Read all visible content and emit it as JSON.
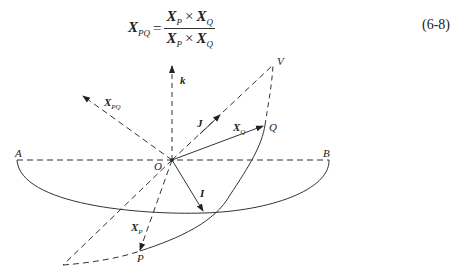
{
  "equation": {
    "lhs": "X",
    "lhs_sub": "PQ",
    "equals": "=",
    "numerator": {
      "a": "X",
      "a_sub": "P",
      "op": "×",
      "b": "X",
      "b_sub": "Q"
    },
    "denominator": {
      "a": "X",
      "a_sub": "P",
      "op": "×",
      "b": "X",
      "b_sub": "Q"
    },
    "number": "(6-8)"
  },
  "diagram": {
    "points": {
      "O": "O",
      "A": "A",
      "B": "B",
      "V": "V",
      "Q": "Q",
      "P": "P"
    },
    "vectors": {
      "k": "k",
      "J": "J",
      "I": "I",
      "XQ": "X",
      "XQ_sub": "Q",
      "XP": "X",
      "XP_sub": "P",
      "XPQ": "X",
      "XPQ_sub": "PQ"
    }
  }
}
